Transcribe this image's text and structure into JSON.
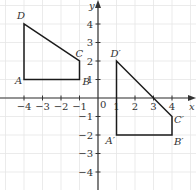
{
  "diagram": {
    "type": "coordinate-plane",
    "axes": {
      "x_label": "x",
      "y_label": "y",
      "origin_label": "0",
      "x_ticks": [
        {
          "value": -4,
          "label": "−4"
        },
        {
          "value": -3,
          "label": "−3"
        },
        {
          "value": -2,
          "label": "−2"
        },
        {
          "value": -1,
          "label": "−1"
        },
        {
          "value": 1,
          "label": "1"
        },
        {
          "value": 2,
          "label": "2"
        },
        {
          "value": 3,
          "label": "3"
        },
        {
          "value": 4,
          "label": "4"
        }
      ],
      "y_ticks": [
        {
          "value": 4,
          "label": "4"
        },
        {
          "value": 3,
          "label": "3"
        },
        {
          "value": 2,
          "label": "2"
        },
        {
          "value": 1,
          "label": "1"
        },
        {
          "value": -1,
          "label": "−1"
        },
        {
          "value": -2,
          "label": "−2"
        },
        {
          "value": -3,
          "label": "−3"
        },
        {
          "value": -4,
          "label": "−4"
        }
      ],
      "range": {
        "x": [
          -5,
          5
        ],
        "y": [
          -5,
          5
        ]
      },
      "grid": true
    },
    "shapes": [
      {
        "name": "ABCD",
        "vertices": [
          {
            "label": "A",
            "x": -4,
            "y": 1
          },
          {
            "label": "B",
            "x": -1,
            "y": 1
          },
          {
            "label": "C",
            "x": -1,
            "y": 2
          },
          {
            "label": "D",
            "x": -4,
            "y": 4
          }
        ]
      },
      {
        "name": "A'B'C'D'",
        "vertices": [
          {
            "label": "A′",
            "x": 1,
            "y": -2
          },
          {
            "label": "B′",
            "x": 4,
            "y": -2
          },
          {
            "label": "C′",
            "x": 4,
            "y": -1
          },
          {
            "label": "D′",
            "x": 1,
            "y": 2
          }
        ]
      }
    ],
    "colors": {
      "grid": "#e6e6e6",
      "axis": "#333333",
      "shape": "#1a1a1a"
    }
  }
}
